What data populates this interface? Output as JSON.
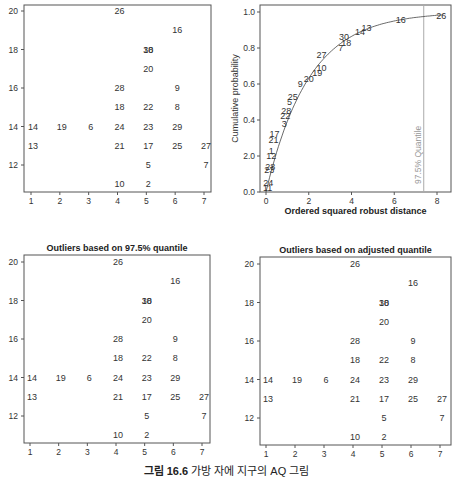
{
  "caption": {
    "prefix": "그림 16.6",
    "text": "가방 자에 지구의 AQ 그림"
  },
  "chart_data": [
    {
      "id": "scatter-original",
      "type": "scatter",
      "title": "",
      "xlabel": "",
      "ylabel": "",
      "xlim": [
        0.8,
        7.2
      ],
      "ylim": [
        10.7,
        20.3
      ],
      "xticks": [
        1,
        2,
        3,
        4,
        5,
        6,
        7
      ],
      "yticks": [
        12,
        14,
        16,
        18,
        20
      ],
      "points": [
        {
          "label": "26",
          "x": 4,
          "y": 20
        },
        {
          "label": "16",
          "x": 6,
          "y": 19
        },
        {
          "label": "30",
          "x": 5,
          "y": 18
        },
        {
          "label": "18",
          "x": 5,
          "y": 18
        },
        {
          "label": "20",
          "x": 5,
          "y": 17
        },
        {
          "label": "28",
          "x": 4,
          "y": 16
        },
        {
          "label": "9",
          "x": 6,
          "y": 16
        },
        {
          "label": "18",
          "x": 4,
          "y": 15
        },
        {
          "label": "22",
          "x": 5,
          "y": 15
        },
        {
          "label": "8",
          "x": 6,
          "y": 15
        },
        {
          "label": "14",
          "x": 1,
          "y": 14
        },
        {
          "label": "19",
          "x": 2,
          "y": 14
        },
        {
          "label": "6",
          "x": 3,
          "y": 14
        },
        {
          "label": "24",
          "x": 4,
          "y": 14
        },
        {
          "label": "23",
          "x": 5,
          "y": 14
        },
        {
          "label": "29",
          "x": 6,
          "y": 14
        },
        {
          "label": "13",
          "x": 1,
          "y": 13
        },
        {
          "label": "21",
          "x": 4,
          "y": 13
        },
        {
          "label": "17",
          "x": 5,
          "y": 13
        },
        {
          "label": "25",
          "x": 6,
          "y": 13
        },
        {
          "label": "27",
          "x": 7,
          "y": 13
        },
        {
          "label": "5",
          "x": 5,
          "y": 12
        },
        {
          "label": "7",
          "x": 7,
          "y": 12
        },
        {
          "label": "10",
          "x": 4,
          "y": 11
        },
        {
          "label": "2",
          "x": 5,
          "y": 11
        }
      ]
    },
    {
      "id": "cdf-plot",
      "type": "line",
      "title": "",
      "xlabel": "Ordered squared robust distance",
      "ylabel": "Cumulative probability",
      "xlim": [
        -0.2,
        8.4
      ],
      "ylim": [
        0,
        1.02
      ],
      "xticks": [
        "0",
        "2",
        "4",
        "6",
        "8"
      ],
      "yticks": [
        "0.0",
        "2.0",
        "0.4",
        "0.6",
        "0.8",
        "1.0"
      ],
      "quantile_line": {
        "x": 7.38,
        "label": "97.5% Quantile"
      },
      "curve": "chi-square CDF (df=2)",
      "points": [
        {
          "label": "11",
          "x": 0.08,
          "y": 0.02
        },
        {
          "label": "24",
          "x": 0.1,
          "y": 0.05
        },
        {
          "label": "23",
          "x": 0.15,
          "y": 0.12
        },
        {
          "label": "28",
          "x": 0.2,
          "y": 0.14
        },
        {
          "label": "12",
          "x": 0.25,
          "y": 0.2
        },
        {
          "label": "1",
          "x": 0.25,
          "y": 0.23
        },
        {
          "label": "21",
          "x": 0.35,
          "y": 0.29
        },
        {
          "label": "17",
          "x": 0.4,
          "y": 0.32
        },
        {
          "label": "3",
          "x": 0.85,
          "y": 0.38
        },
        {
          "label": "22",
          "x": 0.9,
          "y": 0.42
        },
        {
          "label": "28",
          "x": 0.95,
          "y": 0.45
        },
        {
          "label": "5",
          "x": 1.1,
          "y": 0.5
        },
        {
          "label": "25",
          "x": 1.25,
          "y": 0.53
        },
        {
          "label": "9",
          "x": 1.6,
          "y": 0.6
        },
        {
          "label": "20",
          "x": 2.0,
          "y": 0.63
        },
        {
          "label": "19",
          "x": 2.4,
          "y": 0.66
        },
        {
          "label": "10",
          "x": 2.6,
          "y": 0.69
        },
        {
          "label": "27",
          "x": 2.6,
          "y": 0.76
        },
        {
          "label": "7",
          "x": 3.5,
          "y": 0.8
        },
        {
          "label": "18",
          "x": 3.75,
          "y": 0.83
        },
        {
          "label": "30",
          "x": 3.65,
          "y": 0.86
        },
        {
          "label": "14",
          "x": 4.4,
          "y": 0.89
        },
        {
          "label": "13",
          "x": 4.7,
          "y": 0.91
        },
        {
          "label": "16",
          "x": 6.3,
          "y": 0.955
        },
        {
          "label": "26",
          "x": 8.2,
          "y": 0.98
        }
      ]
    },
    {
      "id": "scatter-975-quantile",
      "type": "scatter",
      "title": "Outliers based on 97.5% quantile",
      "xlabel": "",
      "ylabel": "",
      "xlim": [
        0.8,
        7.2
      ],
      "ylim": [
        10.7,
        20.3
      ],
      "xticks": [
        1,
        2,
        3,
        4,
        5,
        6,
        7
      ],
      "yticks": [
        12,
        14,
        16,
        18,
        20
      ],
      "same_points_as": "scatter-original"
    },
    {
      "id": "scatter-adjusted-quantile",
      "type": "scatter",
      "title": "Outliers based on adjusted quantile",
      "xlabel": "",
      "ylabel": "",
      "xlim": [
        0.8,
        7.2
      ],
      "ylim": [
        10.7,
        20.3
      ],
      "xticks": [
        1,
        2,
        3,
        4,
        5,
        6,
        7
      ],
      "yticks": [
        12,
        14,
        16,
        18,
        20
      ],
      "same_points_as": "scatter-original"
    }
  ],
  "colors": {
    "frame": "#555555",
    "text": "#333333",
    "quantile_line": "#aaaaaa",
    "curve": "#444444"
  }
}
